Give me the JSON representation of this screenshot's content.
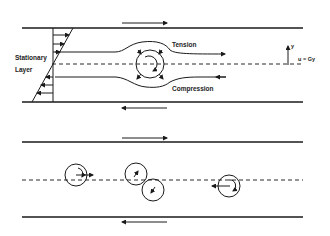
{
  "figure": {
    "top_panel": {
      "labels": {
        "stationary_line1": "Stationary",
        "stationary_line2": "Layer",
        "tension": "Tension",
        "compression": "Compression",
        "y_axis": "y",
        "velocity": "u = Gy"
      },
      "wall_motion": {
        "top": "right",
        "bottom": "left"
      }
    },
    "bottom_panel": {
      "wall_motion": {
        "top": "right",
        "bottom": "left"
      },
      "particles": [
        {
          "id": "particle-1",
          "cx": 76,
          "cy": 175,
          "motion": "translating-right-rotating"
        },
        {
          "id": "particle-2",
          "cx": 136,
          "cy": 174,
          "motion": "rotating-up"
        },
        {
          "id": "particle-3",
          "cx": 153,
          "cy": 190,
          "motion": "rotating-down"
        },
        {
          "id": "particle-4",
          "cx": 229,
          "cy": 186,
          "motion": "translating-left-rotating"
        }
      ]
    },
    "colors": {
      "ink": "#1a1a1a",
      "background": "#ffffff"
    }
  }
}
